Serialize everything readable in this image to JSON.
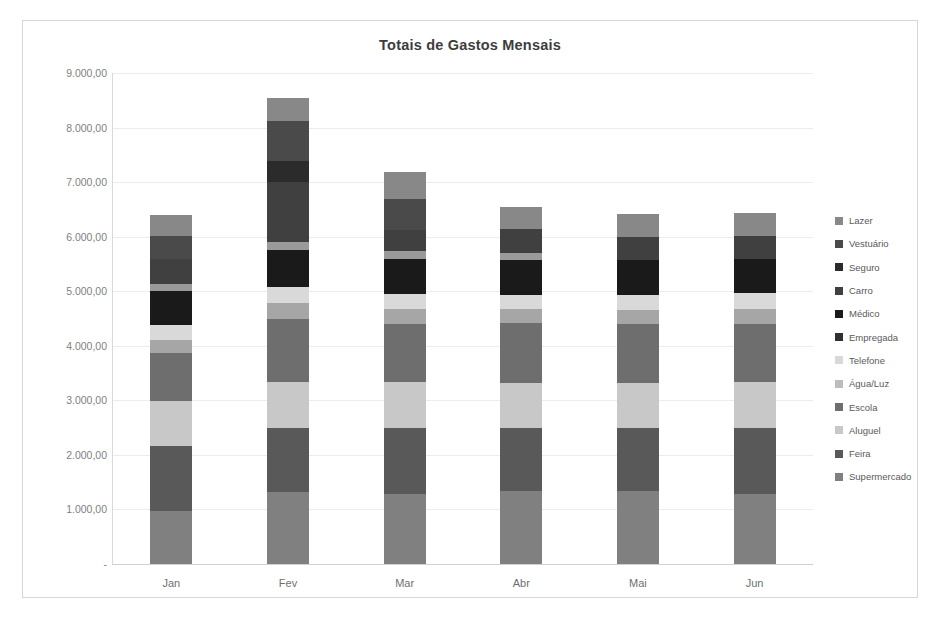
{
  "chart_data": {
    "type": "bar",
    "subtype": "stacked-column",
    "title": "Totais de Gastos Mensais",
    "xlabel": "",
    "ylabel": "",
    "categories": [
      "Jan",
      "Fev",
      "Mar",
      "Abr",
      "Mai",
      "Jun"
    ],
    "ylim": [
      0,
      9000
    ],
    "ytick_values": [
      0,
      1000,
      2000,
      3000,
      4000,
      5000,
      6000,
      7000,
      8000,
      9000
    ],
    "ytick_labels": [
      "-",
      "1.000,00",
      "2.000,00",
      "3.000,00",
      "4.000,00",
      "5.000,00",
      "6.000,00",
      "7.000,00",
      "8.000,00",
      "9.000,00"
    ],
    "grid": true,
    "legend_position": "right",
    "stack_order_bottom_to_top": [
      "Supermercado",
      "Feira",
      "Aluguel",
      "Escola",
      "Água/Luz",
      "Telefone",
      "Empregada",
      "Médico",
      "Carro",
      "Seguro",
      "Vestuário",
      "Lazer"
    ],
    "series": [
      {
        "name": "Supermercado",
        "color": "#808080",
        "values": [
          980,
          1320,
          1290,
          1340,
          1330,
          1280
        ]
      },
      {
        "name": "Feira",
        "color": "#595959",
        "values": [
          1180,
          1180,
          1210,
          1160,
          1170,
          1220
        ]
      },
      {
        "name": "Aluguel",
        "color": "#c8c8c8",
        "values": [
          820,
          840,
          830,
          810,
          820,
          830
        ]
      },
      {
        "name": "Escola",
        "color": "#6e6e6e",
        "values": [
          880,
          1150,
          1070,
          1100,
          1080,
          1070
        ]
      },
      {
        "name": "Água/Luz",
        "color": "#a6a6a6",
        "values": [
          250,
          290,
          270,
          260,
          260,
          280
        ]
      },
      {
        "name": "Telefone",
        "color": "#d9d9d9",
        "values": [
          270,
          290,
          280,
          260,
          270,
          280
        ]
      },
      {
        "name": "Empregada",
        "color": "#1a1a1a",
        "values": [
          620,
          680,
          640,
          650,
          650,
          640
        ]
      },
      {
        "name": "Médico",
        "color": "#9a9a9a",
        "values": [
          130,
          150,
          140,
          130,
          0,
          0
        ]
      },
      {
        "name": "Carro",
        "color": "#404040",
        "values": [
          460,
          1100,
          400,
          430,
          410,
          420
        ]
      },
      {
        "name": "Seguro",
        "color": "#2b2b2b",
        "values": [
          0,
          380,
          0,
          0,
          0,
          0
        ]
      },
      {
        "name": "Vestuário",
        "color": "#4a4a4a",
        "values": [
          420,
          740,
          560,
          0,
          0,
          0
        ]
      },
      {
        "name": "Lazer",
        "color": "#888888",
        "values": [
          390,
          420,
          500,
          410,
          420,
          410
        ]
      }
    ],
    "totals": [
      6400,
      8540,
      6190,
      5820,
      5410,
      5430
    ]
  },
  "legend": {
    "items": [
      {
        "label": "Lazer",
        "color": "#888888"
      },
      {
        "label": "Vestuário",
        "color": "#4a4a4a"
      },
      {
        "label": "Seguro",
        "color": "#2b2b2b"
      },
      {
        "label": "Carro",
        "color": "#404040"
      },
      {
        "label": "Médico",
        "color": "#1a1a1a"
      },
      {
        "label": "Empregada",
        "color": "#303030"
      },
      {
        "label": "Telefone",
        "color": "#d9d9d9"
      },
      {
        "label": "Água/Luz",
        "color": "#bdbdbd"
      },
      {
        "label": "Escola",
        "color": "#6e6e6e"
      },
      {
        "label": "Aluguel",
        "color": "#c8c8c8"
      },
      {
        "label": "Feira",
        "color": "#595959"
      },
      {
        "label": "Supermercado",
        "color": "#808080"
      }
    ]
  }
}
